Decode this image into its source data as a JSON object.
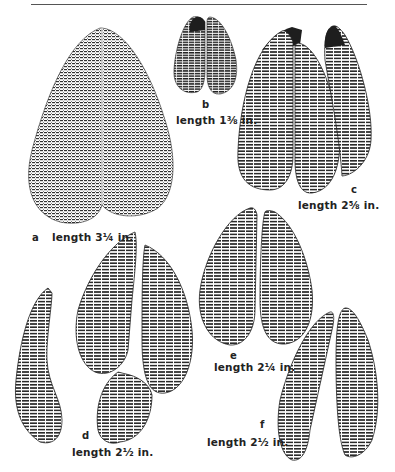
{
  "figure": {
    "tracks": [
      {
        "id": "a",
        "letter": "a",
        "length_label": "length 3¼ in."
      },
      {
        "id": "b",
        "letter": "b",
        "length_label": "length 1⅜ in."
      },
      {
        "id": "c",
        "letter": "c",
        "length_label": "length 2⅝ in."
      },
      {
        "id": "d",
        "letter": "d",
        "length_label": "length 2½ in."
      },
      {
        "id": "e",
        "letter": "e",
        "length_label": "length 2¼ in."
      },
      {
        "id": "f",
        "letter": "f",
        "length_label": "length 2½ in."
      }
    ],
    "colors": {
      "ink": "#222222",
      "paper": "#ffffff"
    }
  }
}
